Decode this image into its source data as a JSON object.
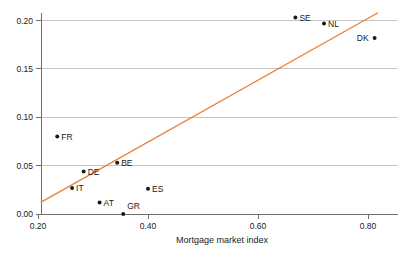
{
  "chart_data": {
    "type": "scatter",
    "title": "",
    "subtitle": "",
    "xlabel": "Mortgage market index",
    "ylabel": "",
    "xlim": [
      0.2,
      0.82
    ],
    "ylim": [
      0.0,
      0.215
    ],
    "xticks": [
      0.2,
      0.4,
      0.6,
      0.8
    ],
    "xticklabels": [
      "0.20",
      "0.40",
      "0.60",
      "0.80"
    ],
    "yticks": [
      0.0,
      0.05,
      0.1,
      0.15,
      0.2
    ],
    "yticklabels": [
      "0.00",
      "0.05",
      "0.10",
      "0.15",
      "0.20"
    ],
    "grid": "horizontal",
    "legend": "none",
    "point_color": "#1a1a1a",
    "line_color": "#ed7d31",
    "grid_color": "#b6b6b6",
    "axis_color": "#6e6e6e",
    "points": [
      {
        "label": "SE",
        "x": 0.668,
        "y": 0.203,
        "label_pos": "right"
      },
      {
        "label": "NL",
        "x": 0.72,
        "y": 0.197,
        "label_pos": "right"
      },
      {
        "label": "DK",
        "x": 0.812,
        "y": 0.182,
        "label_pos": "left"
      },
      {
        "label": "FR",
        "x": 0.235,
        "y": 0.08,
        "label_pos": "right"
      },
      {
        "label": "BE",
        "x": 0.344,
        "y": 0.053,
        "label_pos": "right"
      },
      {
        "label": "DE",
        "x": 0.283,
        "y": 0.044,
        "label_pos": "right"
      },
      {
        "label": "IT",
        "x": 0.262,
        "y": 0.027,
        "label_pos": "right"
      },
      {
        "label": "ES",
        "x": 0.4,
        "y": 0.026,
        "label_pos": "right"
      },
      {
        "label": "AT",
        "x": 0.312,
        "y": 0.012,
        "label_pos": "right"
      },
      {
        "label": "GR",
        "x": 0.355,
        "y": 0.0,
        "label_pos": "right-up"
      }
    ],
    "fit_line": {
      "name": "linear fit",
      "x0": 0.205,
      "y0": 0.012,
      "x1": 0.818,
      "y1": 0.208
    }
  }
}
